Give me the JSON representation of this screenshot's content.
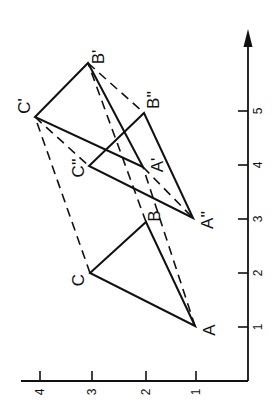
{
  "diagram": {
    "orientation": "rotated 90deg counter-clockwise",
    "x_axis": {
      "ticks": [
        "1",
        "2",
        "3",
        "4",
        "5"
      ],
      "arrow": true
    },
    "y_axis": {
      "ticks": [
        "1",
        "2",
        "3",
        "4"
      ]
    },
    "triangles": [
      {
        "name": "ABC",
        "style": "solid",
        "points": {
          "A": [
            1,
            1
          ],
          "B": [
            3,
            2
          ],
          "C": [
            2,
            3
          ]
        }
      },
      {
        "name": "A'B'C'",
        "style": "solid",
        "points": {
          "A'": [
            4,
            2
          ],
          "B'": [
            6,
            3
          ],
          "C'": [
            5,
            4
          ]
        }
      },
      {
        "name": "A''B''C''",
        "style": "solid",
        "points": {
          "A''": [
            3,
            1
          ],
          "B''": [
            5,
            2
          ],
          "C''": [
            4,
            3
          ]
        }
      }
    ],
    "dashed_links": [
      [
        "A",
        "A'"
      ],
      [
        "B",
        "B'"
      ],
      [
        "C",
        "C'"
      ],
      [
        "A'",
        "A''"
      ],
      [
        "B'",
        "B''"
      ],
      [
        "C'",
        "C''"
      ]
    ],
    "labels": {
      "A": "A",
      "B": "B",
      "C": "C",
      "A1": "A'",
      "B1": "B'",
      "C1": "C'",
      "A2": "A''",
      "B2": "B''",
      "C2": "C''"
    }
  }
}
